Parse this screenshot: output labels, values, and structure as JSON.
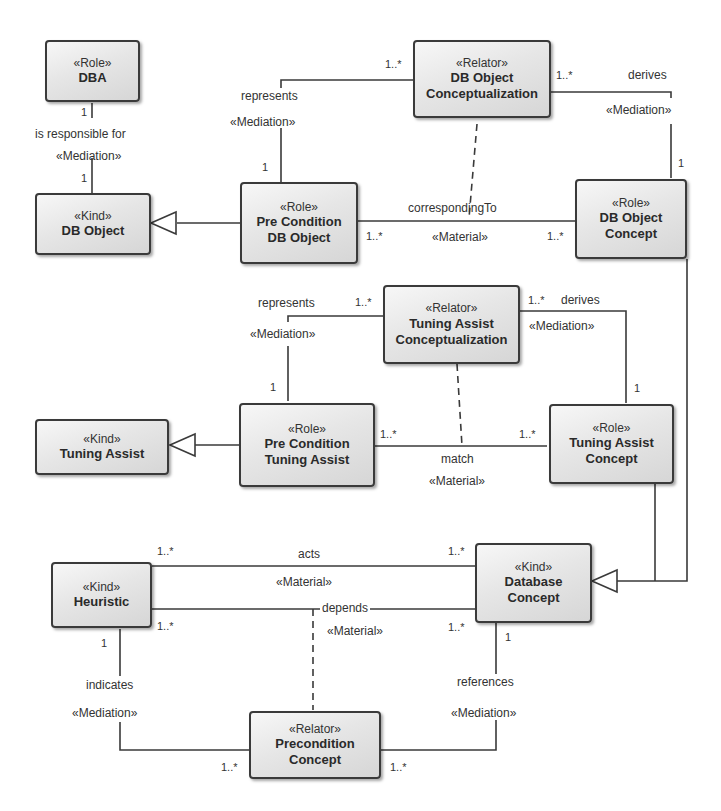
{
  "diagram": {
    "type": "OntoUML class diagram",
    "classes": {
      "dba": {
        "stereotype": "«Role»",
        "name": "DBA"
      },
      "db_object": {
        "stereotype": "«Kind»",
        "name": "DB Object"
      },
      "pre_condition_db_object": {
        "stereotype": "«Role»",
        "name_line1": "Pre Condition",
        "name_line2": "DB Object"
      },
      "db_object_conceptualization": {
        "stereotype": "«Relator»",
        "name_line1": "DB Object",
        "name_line2": "Conceptualization"
      },
      "db_object_concept": {
        "stereotype": "«Role»",
        "name_line1": "DB Object",
        "name_line2": "Concept"
      },
      "tuning_assist": {
        "stereotype": "«Kind»",
        "name": "Tuning Assist"
      },
      "pre_condition_tuning_assist": {
        "stereotype": "«Role»",
        "name_line1": "Pre Condition",
        "name_line2": "Tuning Assist"
      },
      "tuning_assist_conceptualization": {
        "stereotype": "«Relator»",
        "name_line1": "Tuning Assist",
        "name_line2": "Conceptualization"
      },
      "tuning_assist_concept": {
        "stereotype": "«Role»",
        "name_line1": "Tuning Assist",
        "name_line2": "Concept"
      },
      "heuristic": {
        "stereotype": "«Kind»",
        "name": "Heuristic"
      },
      "database_concept": {
        "stereotype": "«Kind»",
        "name_line1": "Database",
        "name_line2": "Concept"
      },
      "precondition_concept": {
        "stereotype": "«Relator»",
        "name_line1": "Precondition",
        "name_line2": "Concept"
      }
    },
    "associations": {
      "is_responsible_for": {
        "name": "is responsible for",
        "stereotype": "«Mediation»",
        "mult_source": "1",
        "mult_target": "1"
      },
      "represents_db": {
        "name": "represents",
        "stereotype": "«Mediation»",
        "mult_relator": "1..*",
        "mult_role": "1"
      },
      "derives_db": {
        "name": "derives",
        "stereotype": "«Mediation»",
        "mult_relator": "1..*",
        "mult_role": "1"
      },
      "corresponding_to": {
        "name": "correspondingTo",
        "stereotype": "«Material»",
        "mult_left": "1..*",
        "mult_right": "1..*"
      },
      "represents_ta": {
        "name": "represents",
        "stereotype": "«Mediation»",
        "mult_relator": "1..*",
        "mult_role": "1"
      },
      "derives_ta": {
        "name": "derives",
        "stereotype": "«Mediation»",
        "mult_relator": "1..*",
        "mult_role": "1"
      },
      "match": {
        "name": "match",
        "stereotype": "«Material»",
        "mult_left": "1..*",
        "mult_right": "1..*"
      },
      "acts": {
        "name": "acts",
        "stereotype": "«Material»",
        "mult_left": "1..*",
        "mult_right": "1..*"
      },
      "depends": {
        "name": "depends",
        "stereotype": "«Material»",
        "mult_left": "1..*",
        "mult_right": "1..*"
      },
      "indicates": {
        "name": "indicates",
        "stereotype": "«Mediation»",
        "mult_kind": "1",
        "mult_relator": "1..*"
      },
      "references": {
        "name": "references",
        "stereotype": "«Mediation»",
        "mult_kind": "1",
        "mult_relator": "1..*"
      }
    },
    "generalizations": [
      {
        "specific": "Pre Condition DB Object",
        "general": "DB Object"
      },
      {
        "specific": "Pre Condition Tuning Assist",
        "general": "Tuning Assist"
      },
      {
        "specific": "DB Object Concept",
        "general": "Database Concept"
      },
      {
        "specific": "Tuning Assist Concept",
        "general": "Database Concept"
      }
    ]
  }
}
